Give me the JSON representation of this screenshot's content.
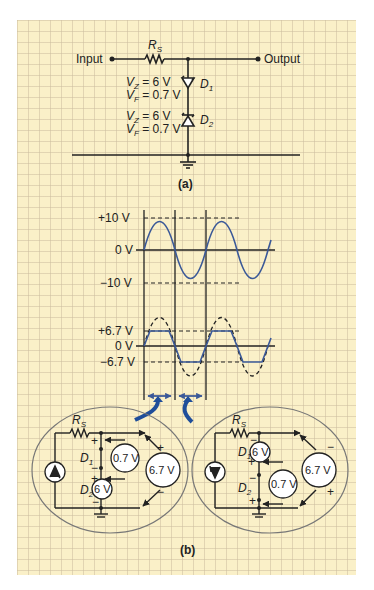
{
  "part_a": {
    "input_label": "Input",
    "output_label": "Output",
    "resistor_label": "R",
    "resistor_sub": "S",
    "d1": {
      "name": "D",
      "sub": "1",
      "vz": "V",
      "vz_sub": "Z",
      "vz_val": " = 6 V",
      "vf": "V",
      "vf_sub": "F",
      "vf_val": " = 0.7 V"
    },
    "d2": {
      "name": "D",
      "sub": "2",
      "vz": "V",
      "vz_sub": "Z",
      "vz_val": " = 6 V",
      "vf": "V",
      "vf_sub": "F",
      "vf_val": " = 0.7 V"
    },
    "caption": "(a)"
  },
  "part_b": {
    "input_wave": {
      "labels": [
        "+10 V",
        "0 V",
        "−10 V"
      ]
    },
    "output_wave": {
      "labels": [
        "+6.7 V",
        "0 V",
        "−6.7 V"
      ]
    },
    "left_circuit": {
      "resistor": "R",
      "resistor_sub": "S",
      "d1": "D",
      "d1_sub": "1",
      "d2": "D",
      "d2_sub": "2",
      "meter_small": "0.7 V",
      "meter_zener": "6 V",
      "meter_total": "6.7 V",
      "plus": "+",
      "minus": "−"
    },
    "right_circuit": {
      "resistor": "R",
      "resistor_sub": "S",
      "d1": "D",
      "d1_sub": "1",
      "d2": "D",
      "d2_sub": "2",
      "meter_small": "0.7 V",
      "meter_zener": "6 V",
      "meter_total": "6.7 V",
      "plus": "+",
      "minus": "−"
    },
    "caption": "(b)"
  },
  "colors": {
    "paper": "#faf0c8",
    "wave": "#3b5998",
    "arrow": "#1f4e9a",
    "ink": "#222222",
    "ellipse": "#777777"
  }
}
